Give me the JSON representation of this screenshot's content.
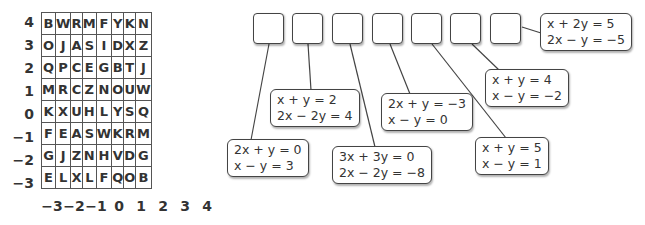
{
  "grid": {
    "row_labels": [
      "4",
      "3",
      "2",
      "1",
      "0",
      "−1",
      "−2",
      "−3"
    ],
    "col_labels": [
      "−3",
      "−2",
      "−1",
      "0",
      "1",
      "2",
      "3",
      "4"
    ],
    "rows": [
      [
        "B",
        "W",
        "R",
        "M",
        "F",
        "Y",
        "K",
        "N"
      ],
      [
        "O",
        "J",
        "A",
        "S",
        "I",
        "D",
        "X",
        "Z"
      ],
      [
        "Q",
        "P",
        "C",
        "E",
        "G",
        "B",
        "T",
        "J"
      ],
      [
        "M",
        "R",
        "C",
        "Z",
        "N",
        "O",
        "U",
        "W"
      ],
      [
        "K",
        "X",
        "U",
        "H",
        "L",
        "Y",
        "S",
        "Q"
      ],
      [
        "F",
        "E",
        "A",
        "S",
        "W",
        "K",
        "R",
        "M"
      ],
      [
        "G",
        "J",
        "Z",
        "N",
        "H",
        "V",
        "D",
        "G"
      ],
      [
        "E",
        "L",
        "X",
        "L",
        "F",
        "Q",
        "O",
        "B"
      ]
    ]
  },
  "answer_boxes": [
    "",
    "",
    "",
    "",
    "",
    "",
    ""
  ],
  "systems": [
    {
      "eq1": "2x + y = 0",
      "eq2": "x − y = 3"
    },
    {
      "eq1": "x + y = 2",
      "eq2": "2x − 2y = 4"
    },
    {
      "eq1": "3x + 3y = 0",
      "eq2": "2x − 2y = −8"
    },
    {
      "eq1": "2x + y = −3",
      "eq2": "x − y = 0"
    },
    {
      "eq1": "x + y = 5",
      "eq2": "x − y = 1"
    },
    {
      "eq1": "x + y = 4",
      "eq2": "x − y = −2"
    },
    {
      "eq1": "x + 2y = 5",
      "eq2": "2x − y = −5"
    }
  ]
}
